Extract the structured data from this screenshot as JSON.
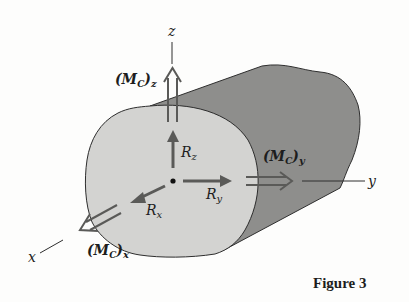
{
  "figure": {
    "caption": "Figure 3",
    "axes": {
      "x": "x",
      "y": "y",
      "z": "z"
    },
    "forces": {
      "rx": {
        "base": "R",
        "sub": "x"
      },
      "ry": {
        "base": "R",
        "sub": "y"
      },
      "rz": {
        "base": "R",
        "sub": "z"
      }
    },
    "moments": {
      "mx": {
        "open": "(M",
        "sub_c": "C",
        "close": ")",
        "sub": "x"
      },
      "my": {
        "open": "(M",
        "sub_c": "C",
        "close": ")",
        "sub": "y"
      },
      "mz": {
        "open": "(M",
        "sub_c": "C",
        "close": ")",
        "sub": "z"
      }
    },
    "colors": {
      "face": "#d3d3d1",
      "body": "#8e8e8c",
      "outline": "#2e2e2e",
      "arrow": "#5a5a58",
      "background": "#fdfdfc"
    }
  }
}
